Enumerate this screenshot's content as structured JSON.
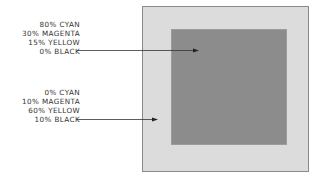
{
  "diagram": {
    "callouts": [
      {
        "target": "inner-square",
        "lines": [
          "80% CYAN",
          "30% MAGENTA",
          "15% YELLOW",
          "0% BLACK"
        ]
      },
      {
        "target": "outer-square",
        "lines": [
          "0% CYAN",
          "10% MAGENTA",
          "60% YELLOW",
          "10% BLACK"
        ]
      }
    ],
    "colors": {
      "outer_fill": "#dcdcdc",
      "inner_fill": "#8c8c8c",
      "border": "#8a8a8a",
      "text": "#333333"
    }
  }
}
